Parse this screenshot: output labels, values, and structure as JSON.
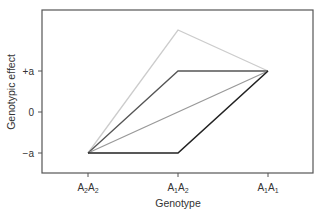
{
  "chart_data": {
    "type": "line",
    "title": "",
    "xlabel": "Genotype",
    "ylabel": "Genotypic effect",
    "categories": [
      "A2A2",
      "A1A2",
      "A1A1"
    ],
    "category_labels": [
      {
        "base1": "A",
        "sub1": "2",
        "base2": "A",
        "sub2": "2"
      },
      {
        "base1": "A",
        "sub1": "1",
        "base2": "A",
        "sub2": "2"
      },
      {
        "base1": "A",
        "sub1": "1",
        "base2": "A",
        "sub2": "1"
      }
    ],
    "y_ticks": [
      {
        "value": 1,
        "label": "+a"
      },
      {
        "value": 0,
        "label": "0"
      },
      {
        "value": -1,
        "label": "−a"
      }
    ],
    "ylim": [
      -1.45,
      2.3
    ],
    "grid": false,
    "legend": null,
    "series": [
      {
        "name": "overdominance",
        "values": [
          -1,
          2,
          1
        ],
        "color": "#cccccc"
      },
      {
        "name": "complete dominance of A1",
        "values": [
          -1,
          1,
          1
        ],
        "color": "#555555"
      },
      {
        "name": "additive",
        "values": [
          -1,
          0,
          1
        ],
        "color": "#999999"
      },
      {
        "name": "complete dominance of A2",
        "values": [
          -1,
          -1,
          1
        ],
        "color": "#222222"
      }
    ]
  }
}
